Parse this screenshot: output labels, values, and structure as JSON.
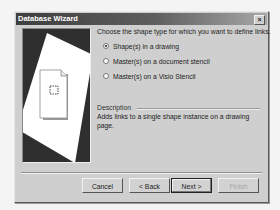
{
  "window": {
    "title": "Database Wizard",
    "close_icon": "close-icon"
  },
  "picture": {
    "icon": "document-with-selected-shape-icon"
  },
  "main": {
    "prompt": "Choose the shape type for which you want to define links.",
    "options": [
      {
        "label": "Shape(s) in a drawing",
        "checked": true
      },
      {
        "label": "Master(s) on a document stencil",
        "checked": false
      },
      {
        "label": "Master(s) on a Visio Stencil",
        "checked": false
      }
    ],
    "description_label": "Description",
    "description_text": "Adds links to a single shape instance on a drawing page."
  },
  "buttons": {
    "cancel": "Cancel",
    "back": "< Back",
    "next": "Next >",
    "finish": "Finish"
  }
}
